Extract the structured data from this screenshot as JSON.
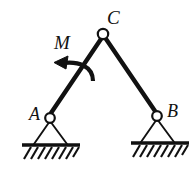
{
  "figure": {
    "type": "statics-free-body-diagram",
    "background_color": "#ffffff",
    "line_color": "#111111",
    "labels": {
      "apex_joint": "C",
      "moment": "M",
      "left_support": "A",
      "right_support": "B"
    },
    "joints": [
      {
        "name": "C",
        "label": "C",
        "x": 103,
        "y": 34,
        "radius": 5.2
      },
      {
        "name": "A",
        "label": "A",
        "x": 50,
        "y": 118,
        "radius": 4.8
      },
      {
        "name": "B",
        "label": "B",
        "x": 157,
        "y": 116,
        "radius": 4.8
      }
    ],
    "members": [
      {
        "name": "member-AC",
        "from": "A",
        "to": "C",
        "x1": 50,
        "y1": 114,
        "x2": 101,
        "y2": 38,
        "thickness": 4.2
      },
      {
        "name": "member-CB",
        "from": "C",
        "to": "B",
        "x1": 106,
        "y1": 38,
        "x2": 156,
        "y2": 112,
        "thickness": 4.2
      }
    ],
    "supports": [
      {
        "name": "support-A",
        "type": "pin",
        "apex_x": 50,
        "apex_y": 122,
        "base_left_x": 33,
        "base_right_x": 68,
        "base_y": 145
      },
      {
        "name": "support-B",
        "type": "pin",
        "apex_x": 157,
        "apex_y": 120,
        "base_left_x": 140,
        "base_right_x": 175,
        "base_y": 143
      }
    ],
    "ground_lines": [
      {
        "name": "ground-left",
        "x1": 22,
        "x2": 80,
        "y": 145,
        "thickness": 3.4,
        "hatch_depth": 14
      },
      {
        "name": "ground-right",
        "x1": 131,
        "x2": 189,
        "y": 143,
        "thickness": 3.4,
        "hatch_depth": 14
      }
    ],
    "moment_arrow": {
      "name": "moment-arrow",
      "direction": "counterclockwise",
      "tip_x": 56,
      "tip_y": 63,
      "tail_x": 92,
      "tail_y": 79
    }
  }
}
